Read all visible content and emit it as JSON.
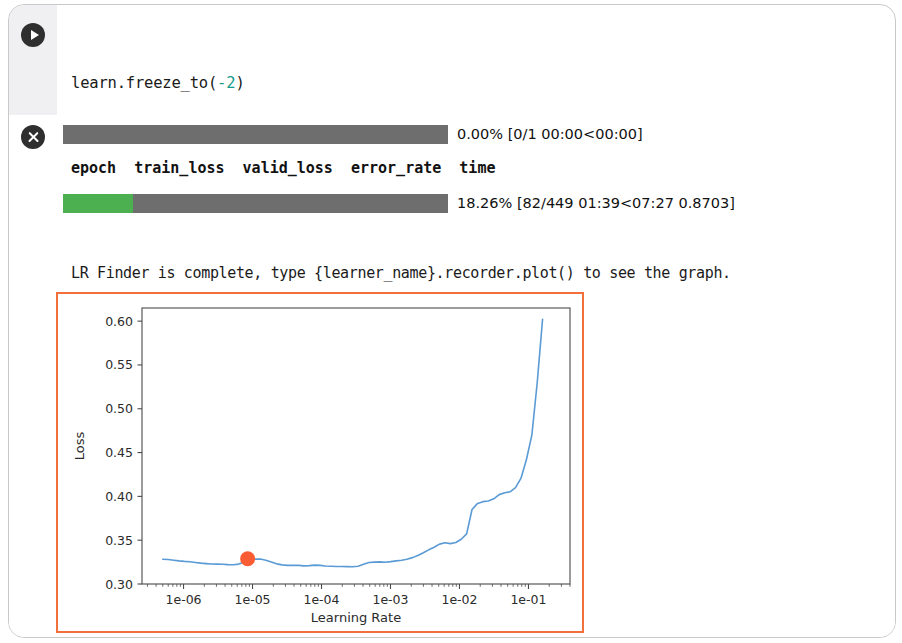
{
  "cell": {
    "run_icon": "play-icon",
    "stop_icon": "close-circle-icon"
  },
  "code": {
    "line1_a": "learn.freeze_to(",
    "line1_num": "-2",
    "line1_b": ")",
    "line2_a": "learn.lr_find",
    "line2_parens": "()",
    "line3_a": "learn.recorder.plot(suggestion=",
    "line3_bool": "True",
    "line3_b": ")",
    "num_color": "#159b8a",
    "bool_color": "#7a69c9"
  },
  "output": {
    "progress_top": {
      "percent": 0,
      "label": "0.00% [0/1 00:00<00:00]"
    },
    "progress_bottom": {
      "percent": 18.26,
      "label": "18.26% [82/449 01:39<07:27 0.8703]",
      "fill_color": "#4caf50"
    },
    "track_color": "#6e6e6e",
    "table_header": "epoch  train_loss  valid_loss  error_rate  time",
    "log": [
      "LR Finder is complete, type {learner_name}.recorder.plot() to see the graph.",
      "Min numerical gradient: 8.32E-06",
      "Min loss divided by 10: 7.59E-06"
    ]
  },
  "chart_data": {
    "type": "line",
    "title": "",
    "xlabel": "Learning Rate",
    "ylabel": "Loss",
    "xscale": "log",
    "xlim": [
      2.5e-07,
      0.4
    ],
    "ylim": [
      0.3,
      0.615
    ],
    "xticks": [
      1e-06,
      1e-05,
      0.0001,
      0.001,
      0.01,
      0.1
    ],
    "xticklabels": [
      "1e-06",
      "1e-05",
      "1e-04",
      "1e-03",
      "1e-02",
      "1e-01"
    ],
    "yticks": [
      0.3,
      0.35,
      0.4,
      0.45,
      0.5,
      0.55,
      0.6
    ],
    "yticklabels": [
      "0.30",
      "0.35",
      "0.40",
      "0.45",
      "0.50",
      "0.55",
      "0.60"
    ],
    "grid": false,
    "legend": null,
    "line_color": "#5b9bd5",
    "marker_color": "#fa5c33",
    "border_color": "#f4703a",
    "series": [
      {
        "name": "loss",
        "x": [
          5e-07,
          6e-07,
          7.2e-07,
          8.6e-07,
          1.03e-06,
          1.24e-06,
          1.48e-06,
          1.78e-06,
          2.13e-06,
          2.55e-06,
          3.06e-06,
          3.67e-06,
          4.4e-06,
          5.27e-06,
          6.31e-06,
          7.57e-06,
          9.07e-06,
          1.09e-05,
          1.3e-05,
          1.56e-05,
          1.87e-05,
          2.24e-05,
          2.69e-05,
          3.22e-05,
          3.86e-05,
          4.63e-05,
          5.55e-05,
          6.65e-05,
          7.97e-05,
          9.55e-05,
          0.000114,
          0.000137,
          0.000165,
          0.000197,
          0.000236,
          0.000283,
          0.00034,
          0.000407,
          0.000488,
          0.000585,
          0.000701,
          0.00084,
          0.00101,
          0.00121,
          0.00145,
          0.00173,
          0.00208,
          0.00249,
          0.00299,
          0.00358,
          0.00429,
          0.00514,
          0.00616,
          0.00739,
          0.00885,
          0.0106,
          0.0127,
          0.0152,
          0.0183,
          0.0219,
          0.0262,
          0.0314,
          0.0377,
          0.0452,
          0.0541,
          0.0649,
          0.0777,
          0.0931,
          0.112,
          0.134,
          0.16
        ],
        "y": [
          0.3283,
          0.328,
          0.3272,
          0.3264,
          0.3258,
          0.3254,
          0.3246,
          0.3238,
          0.3233,
          0.3228,
          0.3227,
          0.3226,
          0.3221,
          0.3219,
          0.3227,
          0.3252,
          0.3272,
          0.3284,
          0.3285,
          0.3272,
          0.3251,
          0.323,
          0.3218,
          0.3212,
          0.3214,
          0.3212,
          0.3207,
          0.321,
          0.3215,
          0.3213,
          0.3206,
          0.3203,
          0.32,
          0.3199,
          0.3198,
          0.3197,
          0.3202,
          0.3226,
          0.3246,
          0.325,
          0.3252,
          0.3249,
          0.3255,
          0.3264,
          0.3271,
          0.3282,
          0.3301,
          0.3326,
          0.3356,
          0.339,
          0.3419,
          0.3455,
          0.347,
          0.3461,
          0.3474,
          0.3511,
          0.3572,
          0.385,
          0.392,
          0.394,
          0.3948,
          0.3972,
          0.402,
          0.4041,
          0.4052,
          0.41,
          0.4205,
          0.4415,
          0.47,
          0.53,
          0.602
        ]
      }
    ],
    "marker": {
      "x": 8.5e-06,
      "y": 0.3288,
      "label": "suggested-lr"
    }
  }
}
